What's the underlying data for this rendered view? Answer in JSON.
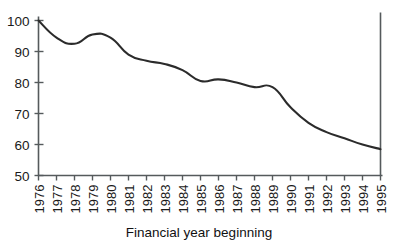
{
  "chart_data": {
    "type": "line",
    "title": "",
    "subtitle": "",
    "xlabel": "Financial year beginning",
    "ylabel": "",
    "categories": [
      "1976",
      "1977",
      "1978",
      "1979",
      "1980",
      "1981",
      "1982",
      "1983",
      "1984",
      "1985",
      "1986",
      "1987",
      "1988",
      "1989",
      "1990",
      "1991",
      "1992",
      "1993",
      "1994",
      "1995"
    ],
    "x": [
      1976,
      1977,
      1978,
      1979,
      1980,
      1981,
      1982,
      1983,
      1984,
      1985,
      1986,
      1987,
      1988,
      1989,
      1990,
      1991,
      1992,
      1993,
      1994,
      1995
    ],
    "values": [
      100,
      94.5,
      92.5,
      95.5,
      94.5,
      89,
      87,
      86,
      84,
      80.5,
      81,
      80,
      78.5,
      78.5,
      72,
      67,
      64,
      62,
      60,
      58.5
    ],
    "series": [
      {
        "name": "index",
        "values": [
          100,
          94.5,
          92.5,
          95.5,
          94.5,
          89,
          87,
          86,
          84,
          80.5,
          81,
          80,
          78.5,
          78.5,
          72,
          67,
          64,
          62,
          60,
          58.5
        ]
      }
    ],
    "ylim": [
      50,
      100
    ],
    "xlim": [
      1976,
      1995
    ],
    "yticks": [
      50,
      60,
      70,
      80,
      90,
      100
    ],
    "ytick_labels": [
      "50",
      "60",
      "70",
      "80",
      "90",
      "100"
    ],
    "xtick_labels": [
      "1976",
      "1977",
      "1978",
      "1979",
      "1980",
      "1981",
      "1982",
      "1983",
      "1984",
      "1985",
      "1986",
      "1987",
      "1988",
      "1989",
      "1990",
      "1991",
      "1992",
      "1993",
      "1994",
      "1995"
    ],
    "grid": false,
    "legend": "none",
    "line_color": "#2b2b2b",
    "axis_color": "#555a5c",
    "background": "#ffffff",
    "xtick_label_rotation": -90
  }
}
